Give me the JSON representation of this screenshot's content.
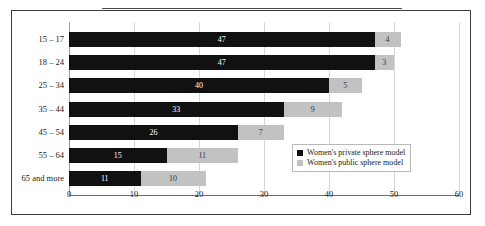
{
  "figure": {
    "frame": true,
    "top_rule": true
  },
  "legend": {
    "position": "inside-bottom-right",
    "entries": [
      {
        "label": "Women's private sphere model",
        "color": "#111111",
        "swatch_name": "legend-swatch-private"
      },
      {
        "label": "Women's public sphere model",
        "color": "#c2c2c2",
        "swatch_name": "legend-swatch-public"
      }
    ]
  },
  "chart_data": {
    "type": "bar",
    "orientation": "horizontal",
    "stacked": true,
    "title": "",
    "subtitle": "",
    "xlabel": "",
    "ylabel": "",
    "xlim": [
      0,
      60
    ],
    "xticks": [
      0,
      10,
      20,
      30,
      40,
      50,
      60
    ],
    "xticklabels": [
      "0",
      "10",
      "20",
      "30",
      "40",
      "50",
      "60"
    ],
    "grid": "vertical",
    "categories": [
      "15 – 17",
      "18 – 24",
      "25 – 34",
      "35 – 44",
      "45 – 54",
      "55 – 64",
      "65 and more"
    ],
    "series": [
      {
        "name": "Women's private sphere model",
        "color": "#111111",
        "values": [
          47,
          47,
          40,
          33,
          26,
          15,
          11
        ],
        "labels": [
          "47",
          "47",
          "40",
          "33",
          "26",
          "15",
          "11"
        ]
      },
      {
        "name": "Women's public sphere model",
        "color": "#c2c2c2",
        "values": [
          4,
          3,
          5,
          9,
          7,
          11,
          10
        ],
        "labels": [
          "4",
          "3",
          "5",
          "9",
          "7",
          "11",
          "10"
        ]
      }
    ],
    "totals": [
      51,
      50,
      45,
      42,
      33,
      26,
      21
    ]
  }
}
